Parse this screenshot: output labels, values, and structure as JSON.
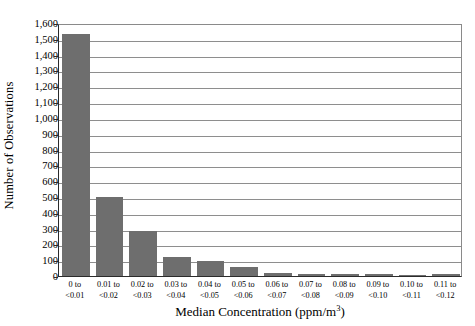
{
  "chart_data": {
    "type": "bar",
    "title": "",
    "xlabel": "Median Concentration (ppm/m",
    "xlabel_sup": "3",
    "xlabel_tail": ")",
    "xlabel_full": "Median Concentration (ppm/m3)",
    "ylabel": "Number of Observations",
    "categories": [
      "0 to <0.01",
      "0.01 to <0.02",
      "0.02 to <0.03",
      "0.03 to <0.04",
      "0.04 to <0.05",
      "0.05 to <0.06",
      "0.06 to <0.07",
      "0.07 to <0.08",
      "0.08 to <0.09",
      "0.09 to <0.10",
      "0.10 to <0.11",
      "0.11 to <0.12"
    ],
    "category_lines": [
      [
        "0 to",
        "<0.01"
      ],
      [
        "0.01 to",
        "<0.02"
      ],
      [
        "0.02 to",
        "<0.03"
      ],
      [
        "0.03 to",
        "<0.04"
      ],
      [
        "0.04 to",
        "<0.05"
      ],
      [
        "0.05 to",
        "<0.06"
      ],
      [
        "0.06 to",
        "<0.07"
      ],
      [
        "0.07 to",
        "<0.08"
      ],
      [
        "0.08 to",
        "<0.09"
      ],
      [
        "0.09 to",
        "<0.10"
      ],
      [
        "0.10 to",
        "<0.11"
      ],
      [
        "0.11 to",
        "<0.12"
      ]
    ],
    "values": [
      1530,
      500,
      285,
      120,
      95,
      55,
      18,
      15,
      12,
      10,
      8,
      10
    ],
    "ylim": [
      0,
      1600
    ],
    "ytick_step": 100,
    "ytick_labels": [
      "0",
      "100",
      "200",
      "300",
      "400",
      "500",
      "600",
      "700",
      "800",
      "900",
      "1,000",
      "1,100",
      "1,200",
      "1,300",
      "1,400",
      "1,500",
      "1,600"
    ],
    "grid": true,
    "grid_axis": "y",
    "legend": null,
    "bar_color": "#6e6e6e",
    "axis_color": "#2b2b2b",
    "grid_color": "#8e8e8e",
    "background": "#ffffff"
  }
}
